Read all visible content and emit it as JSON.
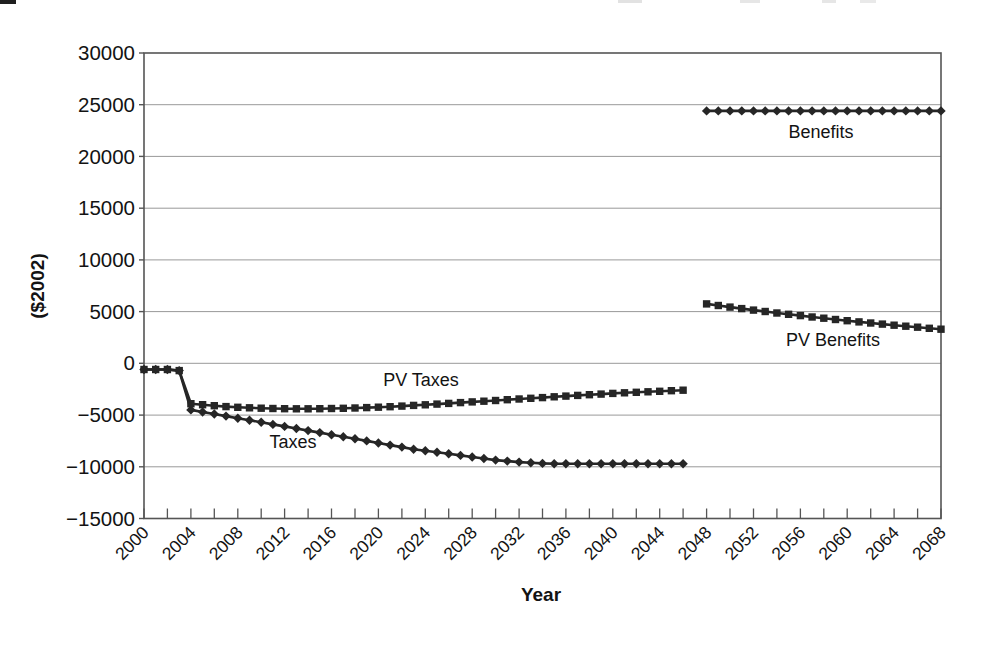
{
  "chart_data": {
    "type": "line",
    "title": "",
    "xlabel": "Year",
    "ylabel": "($2002)",
    "xlim": [
      2000,
      2068
    ],
    "ylim": [
      -15000,
      30000
    ],
    "y_tick_step": 5000,
    "x_label_step": 4,
    "x_minor_tick_step": 2,
    "grid": "horizontal",
    "legend": "inline-annotations",
    "y_tick_labels": [
      "30000",
      "25000",
      "20000",
      "15000",
      "10000",
      "5000",
      "0",
      "−5000",
      "−10000",
      "−15000"
    ],
    "x_tick_labels": [
      "2000",
      "2004",
      "2008",
      "2012",
      "2016",
      "2020",
      "2024",
      "2028",
      "2032",
      "2036",
      "2040",
      "2044",
      "2048",
      "2052",
      "2056",
      "2060",
      "2064",
      "2068"
    ],
    "colors": {
      "line": "#262626",
      "grid": "#999999",
      "frame": "#555555",
      "text": "#131313"
    },
    "series": [
      {
        "name": "Taxes",
        "marker": "diamond",
        "years": [
          2000,
          2001,
          2002,
          2003,
          2004,
          2005,
          2006,
          2007,
          2008,
          2009,
          2010,
          2011,
          2012,
          2013,
          2014,
          2015,
          2016,
          2017,
          2018,
          2019,
          2020,
          2021,
          2022,
          2023,
          2024,
          2025,
          2026,
          2027,
          2028,
          2029,
          2030,
          2031,
          2032,
          2033,
          2034,
          2035,
          2036,
          2037,
          2038,
          2039,
          2040,
          2041,
          2042,
          2043,
          2044,
          2045,
          2046
        ],
        "values": [
          -600,
          -600,
          -600,
          -700,
          -4500,
          -4700,
          -4900,
          -5100,
          -5300,
          -5500,
          -5700,
          -5900,
          -6100,
          -6300,
          -6500,
          -6700,
          -6900,
          -7100,
          -7300,
          -7500,
          -7700,
          -7900,
          -8100,
          -8300,
          -8450,
          -8600,
          -8750,
          -8900,
          -9050,
          -9200,
          -9350,
          -9450,
          -9550,
          -9620,
          -9670,
          -9700,
          -9700,
          -9700,
          -9700,
          -9700,
          -9700,
          -9700,
          -9700,
          -9700,
          -9700,
          -9700,
          -9700
        ]
      },
      {
        "name": "PV Taxes",
        "marker": "square",
        "years": [
          2000,
          2001,
          2002,
          2003,
          2004,
          2005,
          2006,
          2007,
          2008,
          2009,
          2010,
          2011,
          2012,
          2013,
          2014,
          2015,
          2016,
          2017,
          2018,
          2019,
          2020,
          2021,
          2022,
          2023,
          2024,
          2025,
          2026,
          2027,
          2028,
          2029,
          2030,
          2031,
          2032,
          2033,
          2034,
          2035,
          2036,
          2037,
          2038,
          2039,
          2040,
          2041,
          2042,
          2043,
          2044,
          2045,
          2046
        ],
        "values": [
          -600,
          -600,
          -600,
          -700,
          -3900,
          -4000,
          -4100,
          -4180,
          -4250,
          -4300,
          -4340,
          -4370,
          -4390,
          -4400,
          -4400,
          -4390,
          -4370,
          -4350,
          -4320,
          -4280,
          -4240,
          -4190,
          -4130,
          -4070,
          -4010,
          -3940,
          -3870,
          -3800,
          -3730,
          -3660,
          -3590,
          -3520,
          -3450,
          -3380,
          -3310,
          -3240,
          -3170,
          -3100,
          -3030,
          -2970,
          -2910,
          -2850,
          -2800,
          -2750,
          -2700,
          -2650,
          -2600
        ]
      },
      {
        "name": "Benefits",
        "marker": "diamond",
        "years": [
          2048,
          2049,
          2050,
          2051,
          2052,
          2053,
          2054,
          2055,
          2056,
          2057,
          2058,
          2059,
          2060,
          2061,
          2062,
          2063,
          2064,
          2065,
          2066,
          2067,
          2068
        ],
        "values": [
          24400,
          24400,
          24400,
          24400,
          24400,
          24400,
          24400,
          24400,
          24400,
          24400,
          24400,
          24400,
          24400,
          24400,
          24400,
          24400,
          24400,
          24400,
          24400,
          24400,
          24400
        ]
      },
      {
        "name": "PV Benefits",
        "marker": "square",
        "years": [
          2048,
          2049,
          2050,
          2051,
          2052,
          2053,
          2054,
          2055,
          2056,
          2057,
          2058,
          2059,
          2060,
          2061,
          2062,
          2063,
          2064,
          2065,
          2066,
          2067,
          2068
        ],
        "values": [
          5750,
          5590,
          5440,
          5290,
          5150,
          5010,
          4870,
          4740,
          4610,
          4480,
          4360,
          4240,
          4120,
          4010,
          3900,
          3790,
          3690,
          3590,
          3490,
          3390,
          3300
        ]
      }
    ],
    "annotations": [
      {
        "label": "Benefits",
        "year": 2058,
        "value": 22100
      },
      {
        "label": "PV Benefits",
        "year": 2059,
        "value": 2000
      },
      {
        "label": "PV Taxes",
        "year": 2024,
        "value": -1850
      },
      {
        "label": "Taxes",
        "year": 2013,
        "value": -7900
      }
    ]
  }
}
